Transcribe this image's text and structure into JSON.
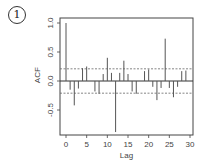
{
  "panel_label": "1",
  "chart_data": {
    "type": "bar",
    "title": "",
    "xlabel": "Lag",
    "ylabel": "ACF",
    "xlim": [
      0,
      30
    ],
    "ylim": [
      -0.9,
      1.1
    ],
    "x_ticks": [
      0,
      5,
      10,
      15,
      20,
      25,
      30
    ],
    "y_ticks": [
      -0.5,
      0.0,
      0.5,
      1.0
    ],
    "x_tick_labels": [
      "0",
      "5",
      "10",
      "15",
      "20",
      "25",
      "30"
    ],
    "y_tick_labels": [
      "-0.5",
      "0.0",
      "0.5",
      "1.0"
    ],
    "confidence_bound": 0.21,
    "grid": false,
    "legend": null,
    "categories": [
      0,
      1,
      2,
      3,
      4,
      5,
      6,
      7,
      8,
      9,
      10,
      11,
      12,
      13,
      14,
      15,
      16,
      17,
      18,
      19,
      20,
      21,
      22,
      23,
      24,
      25,
      26,
      27,
      28,
      29,
      30
    ],
    "values": [
      1.0,
      -0.15,
      -0.42,
      -0.13,
      0.22,
      0.25,
      0.0,
      -0.18,
      -0.22,
      0.12,
      0.4,
      0.14,
      -0.88,
      0.14,
      0.35,
      0.12,
      -0.18,
      -0.22,
      0.0,
      0.17,
      0.2,
      -0.1,
      -0.33,
      -0.12,
      0.73,
      -0.12,
      -0.28,
      -0.1,
      0.17,
      0.18,
      0.0
    ]
  },
  "colors": {
    "bars": "#555555",
    "axis": "#444444",
    "bounds": "#666666"
  }
}
